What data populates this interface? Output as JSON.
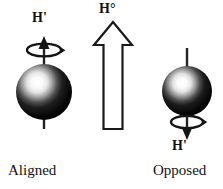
{
  "figure": {
    "width": 223,
    "height": 189,
    "background_color": "#ffffff",
    "ink_color": "#111111"
  },
  "labels": {
    "h_prime_left": "H'",
    "h_zero": "H°",
    "h_prime_right": "H'",
    "caption_aligned": "Aligned",
    "caption_opposed": "Opposed"
  },
  "elements": {
    "left_spin": {
      "name": "aligned-spin-group",
      "sphere": {
        "cx": 44,
        "cy": 92,
        "r": 28,
        "fill_dark": "#0a0a0a",
        "highlight": "#ffffff"
      },
      "axis_direction": "up",
      "arrow_tip_y": 37,
      "axis_bottom_y": 129,
      "precession_ring": {
        "cx": 44,
        "cy": 50,
        "rx": 17,
        "ry": 6
      },
      "label_position": "above"
    },
    "field_arrow": {
      "name": "external-field-arrow",
      "direction": "up",
      "fill": "#ffffff",
      "stroke": "#111111",
      "tip_y": 22,
      "base_y": 129,
      "shaft_width": 18,
      "head_width": 38,
      "center_x": 113
    },
    "right_spin": {
      "name": "opposed-spin-group",
      "sphere": {
        "cx": 187,
        "cy": 91,
        "r": 25,
        "fill_dark": "#0a0a0a",
        "highlight": "#ffffff"
      },
      "axis_direction": "down",
      "axis_top_y": 48,
      "arrow_tip_y": 137,
      "precession_ring": {
        "cx": 187,
        "cy": 122,
        "rx": 16,
        "ry": 6
      },
      "label_position": "below"
    }
  }
}
